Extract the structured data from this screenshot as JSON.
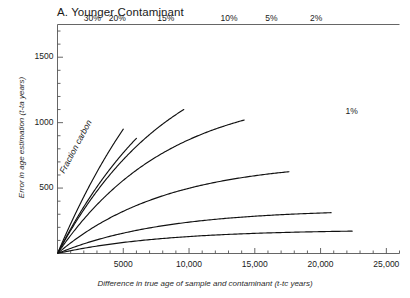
{
  "panel": {
    "label": "A. Younger Contaminant"
  },
  "annotations": {
    "fraction_carbon": "Fraction carbon"
  },
  "axes": {
    "x": {
      "title": "Difference in true age of sample and contaminant (t-tc years)",
      "ticks": [
        {
          "value": 5000,
          "label": "5000"
        },
        {
          "value": 10000,
          "label": "10,000"
        },
        {
          "value": 15000,
          "label": "15,000"
        },
        {
          "value": 20000,
          "label": "20,000"
        },
        {
          "value": 25000,
          "label": "25,000"
        }
      ],
      "minor_step": 1000,
      "range": [
        0,
        26000
      ]
    },
    "y": {
      "title": "Error in age estimation (t-ta years)",
      "ticks": [
        {
          "value": 500,
          "label": "500"
        },
        {
          "value": 1000,
          "label": "1000"
        },
        {
          "value": 1500,
          "label": "1500"
        }
      ],
      "minor_step": 100,
      "range": [
        0,
        1750
      ]
    }
  },
  "chart_data": {
    "type": "line",
    "title": "A. Younger Contaminant",
    "xlabel": "Difference in true age of sample and contaminant (t-tc years)",
    "ylabel": "Error in age estimation (t-ta years)",
    "xlim": [
      0,
      26000
    ],
    "ylim": [
      0,
      1750
    ],
    "grid": false,
    "legend": "inline-curve-labels",
    "annotations": [
      "Fraction carbon"
    ],
    "series": [
      {
        "name": "30%",
        "fraction": 0.3,
        "label": "30%",
        "label_x": 2600,
        "label_y": 1780,
        "x": [
          0,
          500,
          1000,
          1500,
          2000,
          2500,
          3000,
          3500,
          4000,
          4500,
          5000
        ],
        "y": [
          0,
          160,
          290,
          400,
          490,
          570,
          640,
          710,
          780,
          860,
          950
        ]
      },
      {
        "name": "20%",
        "fraction": 0.2,
        "label": "20%",
        "label_x": 4500,
        "label_y": 1780,
        "x": [
          0,
          500,
          1000,
          1500,
          2000,
          2500,
          3000,
          3500,
          4000,
          4500,
          5000,
          5500,
          6000
        ],
        "y": [
          0,
          105,
          195,
          275,
          345,
          410,
          470,
          530,
          590,
          650,
          715,
          790,
          880
        ]
      },
      {
        "name": "15%",
        "fraction": 0.15,
        "label": "15%",
        "label_x": 8200,
        "label_y": 1780,
        "x": [
          0,
          1000,
          2000,
          3000,
          4000,
          5000,
          6000,
          7000,
          8000,
          9000,
          9600
        ],
        "y": [
          0,
          150,
          270,
          370,
          465,
          555,
          650,
          750,
          865,
          1000,
          1100
        ]
      },
      {
        "name": "10%",
        "fraction": 0.1,
        "label": "10%",
        "label_x": 13000,
        "label_y": 1780,
        "x": [
          0,
          1000,
          2000,
          3000,
          4000,
          5000,
          7000,
          9000,
          11000,
          13000,
          14200
        ],
        "y": [
          0,
          102,
          190,
          265,
          332,
          394,
          505,
          615,
          740,
          900,
          1020
        ]
      },
      {
        "name": "5%",
        "fraction": 0.05,
        "label": "5%",
        "label_x": 16400,
        "label_y": 1780,
        "x": [
          0,
          1000,
          2000,
          3000,
          5000,
          7000,
          9000,
          11000,
          13000,
          15000,
          17000,
          17600
        ],
        "y": [
          0,
          52,
          98,
          138,
          205,
          262,
          315,
          370,
          430,
          500,
          590,
          625
        ]
      },
      {
        "name": "2%",
        "fraction": 0.02,
        "label": "2%",
        "label_x": 19800,
        "label_y": 1780,
        "x": [
          0,
          2000,
          4000,
          6000,
          8000,
          10000,
          12000,
          14000,
          16000,
          18000,
          20000,
          20800
        ],
        "y": [
          0,
          40,
          74,
          103,
          129,
          154,
          178,
          203,
          229,
          259,
          295,
          312
        ]
      },
      {
        "name": "1%",
        "fraction": 0.01,
        "label": "1%",
        "label_x": 22500,
        "label_y": 1130,
        "x": [
          0,
          2000,
          4000,
          6000,
          8000,
          10000,
          12000,
          14000,
          16000,
          18000,
          20000,
          22000,
          22400
        ],
        "y": [
          0,
          20,
          38,
          53,
          66,
          79,
          91,
          103,
          116,
          130,
          146,
          166,
          171
        ]
      }
    ]
  },
  "colors": {
    "line": "#111111",
    "axis": "#555555",
    "text": "#1a1a1a",
    "background": "#ffffff"
  }
}
